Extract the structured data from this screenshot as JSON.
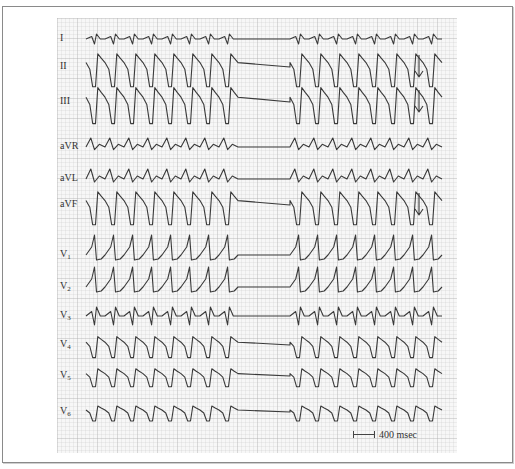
{
  "figure": {
    "type": "12-lead ECG",
    "scale_bar_label": "400 msec",
    "trace_color": "#3a3a3a",
    "grid_color": "#d0d0d0",
    "arrows_on_leads": [
      "II",
      "III",
      "aVF"
    ]
  },
  "leads": [
    {
      "name": "I",
      "label": "I",
      "sub": "",
      "y": 39,
      "amp": 5,
      "shape": "small"
    },
    {
      "name": "II",
      "label": "II",
      "sub": "",
      "y": 67,
      "amp": 22,
      "shape": "deep"
    },
    {
      "name": "III",
      "label": "III",
      "sub": "",
      "y": 102,
      "amp": 24,
      "shape": "deep"
    },
    {
      "name": "aVR",
      "label": "aVR",
      "sub": "",
      "y": 147,
      "amp": 9,
      "shape": "up"
    },
    {
      "name": "aVL",
      "label": "aVL",
      "sub": "",
      "y": 179,
      "amp": 10,
      "shape": "up"
    },
    {
      "name": "aVF",
      "label": "aVF",
      "sub": "",
      "y": 205,
      "amp": 22,
      "shape": "deep"
    },
    {
      "name": "V1",
      "label": "V",
      "sub": "1",
      "y": 255,
      "amp": 20,
      "shape": "tall"
    },
    {
      "name": "V2",
      "label": "V",
      "sub": "2",
      "y": 287,
      "amp": 20,
      "shape": "tall"
    },
    {
      "name": "V3",
      "label": "V",
      "sub": "3",
      "y": 316,
      "amp": 9,
      "shape": "small"
    },
    {
      "name": "V4",
      "label": "V",
      "sub": "4",
      "y": 345,
      "amp": 14,
      "shape": "deep"
    },
    {
      "name": "V5",
      "label": "V",
      "sub": "5",
      "y": 376,
      "amp": 12,
      "shape": "deep"
    },
    {
      "name": "V6",
      "label": "V",
      "sub": "6",
      "y": 412,
      "amp": 10,
      "shape": "deep"
    }
  ],
  "rhythm": {
    "x_start": 86,
    "x_end": 456,
    "beat_width": 19,
    "pause_start": 245,
    "pause_end": 290,
    "beats_after_pause": 9
  }
}
